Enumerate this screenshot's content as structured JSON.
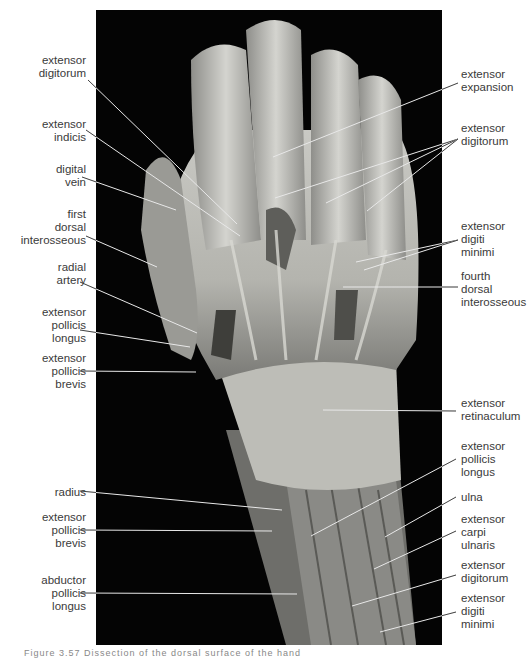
{
  "figure": {
    "caption_fragment": "Figure 3.57  Dissection of the dorsal surface of the hand",
    "background_color": "#040404",
    "photo_tone": "#b8b8b4"
  },
  "labels_left": [
    {
      "id": "l1",
      "text": "extensor\ndigitorum",
      "x": 86,
      "y": 54,
      "line": [
        [
          88,
          80
        ],
        [
          237,
          224
        ]
      ]
    },
    {
      "id": "l2",
      "text": "extensor\nindicis",
      "x": 86,
      "y": 118,
      "line": [
        [
          86,
          130
        ],
        [
          240,
          236
        ]
      ]
    },
    {
      "id": "l3",
      "text": "digital\nvein",
      "x": 86,
      "y": 163,
      "line": [
        [
          82,
          177
        ],
        [
          176,
          210
        ]
      ]
    },
    {
      "id": "l4",
      "text": "first\ndorsal\ninterosseous",
      "x": 86,
      "y": 208,
      "line": [
        [
          86,
          236
        ],
        [
          157,
          267
        ]
      ]
    },
    {
      "id": "l5",
      "text": "radial\nartery",
      "x": 86,
      "y": 261,
      "line": [
        [
          80,
          282
        ],
        [
          197,
          333
        ]
      ]
    },
    {
      "id": "l6",
      "text": "extensor\npollicis\nlongus",
      "x": 86,
      "y": 306,
      "line": [
        [
          80,
          330
        ],
        [
          190,
          347
        ]
      ]
    },
    {
      "id": "l7",
      "text": "extensor\npollicis\nbrevis",
      "x": 86,
      "y": 352,
      "line": [
        [
          80,
          371
        ],
        [
          196,
          372
        ]
      ]
    },
    {
      "id": "l8",
      "text": "radius",
      "x": 86,
      "y": 486,
      "line": [
        [
          80,
          491
        ],
        [
          282,
          510
        ]
      ]
    },
    {
      "id": "l9",
      "text": "extensor\npollicis\nbrevis",
      "x": 86,
      "y": 511,
      "line": [
        [
          80,
          530
        ],
        [
          272,
          531
        ]
      ]
    },
    {
      "id": "l10",
      "text": "abductor\npollicis\nlongus",
      "x": 86,
      "y": 574,
      "line": [
        [
          80,
          593
        ],
        [
          297,
          594
        ]
      ]
    }
  ],
  "labels_right": [
    {
      "id": "r1",
      "text": "extensor\nexpansion",
      "x": 461,
      "y": 68,
      "lines": [
        [
          [
            458,
            83
          ],
          [
            273,
            157
          ]
        ]
      ]
    },
    {
      "id": "r2",
      "text": "extensor\ndigitorum",
      "x": 461,
      "y": 122,
      "lines": [
        [
          [
            458,
            139
          ],
          [
            275,
            198
          ]
        ],
        [
          [
            458,
            139
          ],
          [
            326,
            203
          ]
        ],
        [
          [
            458,
            139
          ],
          [
            367,
            211
          ]
        ]
      ]
    },
    {
      "id": "r3",
      "text": "extensor\ndigiti\nminimi",
      "x": 461,
      "y": 220,
      "lines": [
        [
          [
            458,
            240
          ],
          [
            356,
            262
          ]
        ],
        [
          [
            458,
            240
          ],
          [
            364,
            270
          ]
        ]
      ]
    },
    {
      "id": "r4",
      "text": "fourth\ndorsal\ninterosseous",
      "x": 461,
      "y": 270,
      "lines": [
        [
          [
            458,
            287
          ],
          [
            343,
            287
          ]
        ]
      ]
    },
    {
      "id": "r5",
      "text": "extensor\nretinaculum",
      "x": 461,
      "y": 397,
      "lines": [
        [
          [
            456,
            411
          ],
          [
            323,
            410
          ]
        ]
      ]
    },
    {
      "id": "r6",
      "text": "extensor\npollicis\nlongus",
      "x": 461,
      "y": 440,
      "lines": [
        [
          [
            456,
            459
          ],
          [
            311,
            536
          ]
        ]
      ]
    },
    {
      "id": "r7",
      "text": "ulna",
      "x": 461,
      "y": 491,
      "lines": [
        [
          [
            456,
            497
          ],
          [
            385,
            537
          ]
        ]
      ]
    },
    {
      "id": "r8",
      "text": "extensor\ncarpi\nulnaris",
      "x": 461,
      "y": 513,
      "lines": [
        [
          [
            456,
            531
          ],
          [
            374,
            569
          ]
        ]
      ]
    },
    {
      "id": "r9",
      "text": "extensor\ndigitorum",
      "x": 461,
      "y": 559,
      "lines": [
        [
          [
            456,
            575
          ],
          [
            352,
            606
          ]
        ]
      ]
    },
    {
      "id": "r10",
      "text": "extensor\ndigiti\nminimi",
      "x": 461,
      "y": 592,
      "lines": [
        [
          [
            456,
            612
          ],
          [
            380,
            632
          ]
        ]
      ]
    }
  ]
}
